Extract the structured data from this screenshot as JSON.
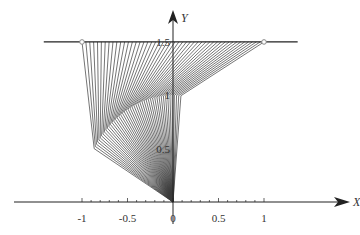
{
  "diagram": {
    "type": "linkage-fan",
    "colors": {
      "axis": "#222222",
      "lines": "#3a3a3a",
      "marker_fill": "#ffffff",
      "marker_stroke": "#888888",
      "background": "#ffffff"
    },
    "axes": {
      "x_label": "X",
      "y_label": "Y",
      "x_ticks": [
        {
          "value": -1,
          "label": "-1"
        },
        {
          "value": -0.5,
          "label": "-0.5"
        },
        {
          "value": 0,
          "label": "0"
        },
        {
          "value": 0.5,
          "label": "0.5"
        },
        {
          "value": 1,
          "label": "1"
        }
      ],
      "y_ticks": [
        {
          "value": 0.5,
          "label": "0.5"
        },
        {
          "value": 1,
          "label": "1"
        },
        {
          "value": 1.5,
          "label": "1.5"
        }
      ],
      "x_minor_step": 0.1,
      "x_range": [
        -1.45,
        1.8
      ],
      "y_range": [
        0,
        1.85
      ]
    },
    "guide_line": {
      "y": 1.5,
      "x_start": -1.42,
      "x_end": 1.37
    },
    "endpoints": [
      {
        "x": -1.0,
        "y": 1.5
      },
      {
        "x": 1.0,
        "y": 1.5
      }
    ],
    "fan": {
      "line_count": 48,
      "top_y": 1.5,
      "top_x_start": -1.0,
      "top_x_end": 1.0,
      "arc_radius": 1.0,
      "arc_angle_start_deg": 150,
      "arc_angle_end_deg": 85,
      "pivot": {
        "x": 0,
        "y": 0
      }
    }
  }
}
